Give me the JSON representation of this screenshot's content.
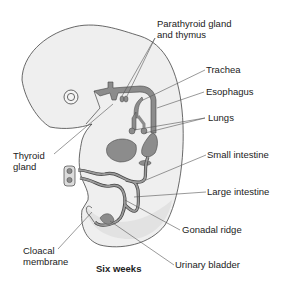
{
  "diagram": {
    "title": "Six weeks",
    "colors": {
      "background": "#ffffff",
      "body_fill": "#efefef",
      "body_inner_fill": "#e4e4e4",
      "organ_fill": "#8c8c8c",
      "outline": "#444444",
      "leader_line": "#555555",
      "text": "#222222"
    },
    "labels": [
      {
        "id": "parathyroid",
        "line1": "Parathyroid gland",
        "line2": "and thymus"
      },
      {
        "id": "trachea",
        "line1": "Trachea"
      },
      {
        "id": "esophagus",
        "line1": "Esophagus"
      },
      {
        "id": "lungs",
        "line1": "Lungs"
      },
      {
        "id": "thyroid",
        "line1": "Thyroid",
        "line2": "gland"
      },
      {
        "id": "small_intestine",
        "line1": "Small intestine"
      },
      {
        "id": "large_intestine",
        "line1": "Large intestine"
      },
      {
        "id": "gonadal_ridge",
        "line1": "Gonadal ridge"
      },
      {
        "id": "cloacal",
        "line1": "Cloacal",
        "line2": "membrane"
      },
      {
        "id": "urinary_bladder",
        "line1": "Urinary bladder"
      }
    ]
  }
}
